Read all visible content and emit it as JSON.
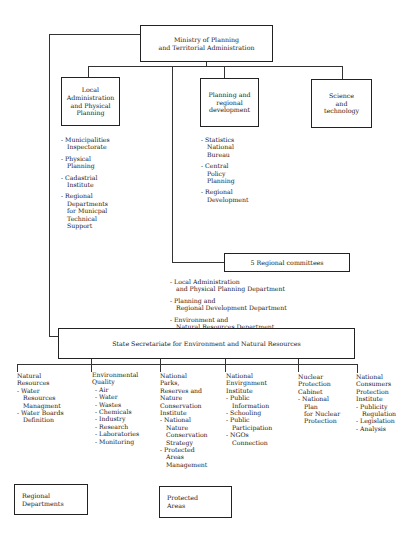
{
  "ministry": {
    "title": "Ministry of Planning\nand Territorial Administration"
  },
  "departments": [
    {
      "title": "Local\nAdministration\nand Physical\nPlanning",
      "items": [
        "- Municipalities\nInspectorate",
        "- Physical\nPlanning",
        "- Cadastrial\nInstitute",
        "- Regional\nDepartments\nfor Municpal\nTechnical\nSupport"
      ]
    },
    {
      "title": "Planning and\nregional\ndevelopment",
      "items": [
        "- Statistics\nNational\nBureau",
        "- Central\nPolicy\nPlanning",
        "- Regional\nDevelopment"
      ]
    },
    {
      "title": "Science\nand\ntechnology",
      "items": []
    }
  ],
  "regional_committees": {
    "title": "5 Regional  committees",
    "items": [
      "- Local Administration\nand Physical Planning Department",
      "- Planning and\nRegional Development Department",
      "- Environment and\nNatural Resources Department"
    ]
  },
  "state_secretariate": {
    "title": "State Secretariate for Environment and Natural Resources"
  },
  "units": [
    {
      "head": "Natural\nResources",
      "items": [
        "- Water\nResources\nManagment",
        "- Water  Boards\nDefinition"
      ]
    },
    {
      "head": "Environmental\nQuality",
      "items": [
        "- Air",
        "- Water",
        "- Wastes",
        "- Chemicals",
        "- Industry",
        "- Research",
        "- Laboratories",
        "- Monitoring"
      ]
    },
    {
      "head": "National\nParks,\nReserves and\nNature\nConservation\nInstitute",
      "items": [
        "- National\nNature\nConservation\nStrategy",
        "- Protected\nAreas\nManagement"
      ]
    },
    {
      "head": "National\nEnvirgnment\nInstitute",
      "items": [
        "- Public\nInformation",
        "- Schooling",
        "- Public\nParticipation",
        "- NGOs\nConnection"
      ]
    },
    {
      "head": "Nuclear\nProtection\nCabinet",
      "items": [
        "- National\nPlan\nfor Nuclear\nProtection"
      ]
    },
    {
      "head": "National\nConsumers\nProtection\nInstitute",
      "items": [
        "- Publicity\nRegulation",
        "- Legislation",
        "- Analysis"
      ]
    }
  ],
  "bottom_boxes": {
    "regional_departments": "Regional\nDepartments",
    "protected_areas": "Protected\nAreas"
  }
}
